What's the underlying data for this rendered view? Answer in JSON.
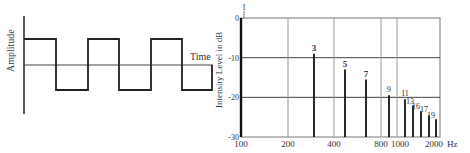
{
  "left_plot": {
    "ylabel": "Amplitude",
    "xlabel": "Time",
    "waveform": "square",
    "transitions_x": [
      24,
      56,
      88,
      119,
      151,
      182,
      212
    ],
    "high_y": 39,
    "low_y": 90,
    "axis_y": 65
  },
  "chart_data": {
    "type": "bar",
    "title": "",
    "xlabel": "Hz",
    "ylabel": "Intensity Level in dB",
    "x_scale": "log",
    "xlim": [
      100,
      2000
    ],
    "ylim": [
      -30,
      0
    ],
    "x_ticks": [
      "100",
      "200",
      "400",
      "800",
      "1000",
      "2000"
    ],
    "y_ticks": [
      "0",
      "-10",
      "-20",
      "-30"
    ],
    "grid": true,
    "harmonics": [
      {
        "label": "1",
        "freq": 100,
        "db": 0
      },
      {
        "label": "3",
        "freq": 300,
        "db": -9
      },
      {
        "label": "5",
        "freq": 500,
        "db": -13
      },
      {
        "label": "7",
        "freq": 700,
        "db": -15.5
      },
      {
        "label": "9",
        "freq": 900,
        "db": -19.5
      },
      {
        "label": "11",
        "freq": 1100,
        "db": -20.5
      },
      {
        "label": "13",
        "freq": 1300,
        "db": -22
      },
      {
        "label": "15",
        "freq": 1500,
        "db": -23.5
      },
      {
        "label": "17",
        "freq": 1700,
        "db": -24.5
      },
      {
        "label": "19",
        "freq": 1900,
        "db": -25.5
      }
    ],
    "bar_labels_shown": [
      "3",
      "5",
      "7",
      "9",
      "11",
      "13",
      "16",
      "17",
      "19"
    ]
  },
  "labels": {
    "amplitude": "Amplitude",
    "time": "Time",
    "intensity": "Intensity Level in dB",
    "hz": "Hz",
    "top_tick_marker": "1"
  }
}
